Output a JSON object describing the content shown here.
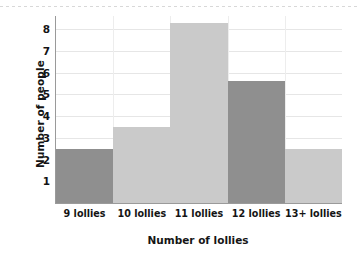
{
  "chart_data": {
    "type": "bar",
    "title": "",
    "subtitle": "",
    "xlabel": "Number of lollies",
    "ylabel": "Number of people",
    "categories": [
      "9 lollies",
      "10 lollies",
      "11 lollies",
      "12 lollies",
      "13+ lollies"
    ],
    "values": [
      2.5,
      3.5,
      8.3,
      5.6,
      2.5
    ],
    "bar_colors": [
      "#8f8f8f",
      "#cacaca",
      "#cacaca",
      "#8f8f8f",
      "#cacaca"
    ],
    "ylim": [
      0,
      8.6
    ],
    "yticks": [
      1,
      2,
      3,
      4,
      5,
      6,
      7,
      8
    ],
    "ytick_labels": [
      "1",
      "2",
      "3",
      "4",
      "5",
      "6",
      "7",
      "8"
    ],
    "grid": "horizontal-and-vertical",
    "legend": "none",
    "annotations": [],
    "axis_color": "#9a9a9a",
    "gridline_color": "#e6e6e6",
    "background": "#ffffff"
  }
}
